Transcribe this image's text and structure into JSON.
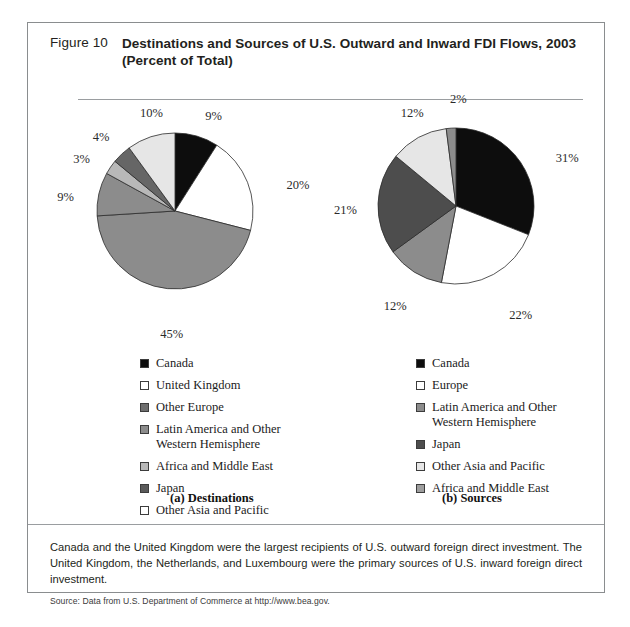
{
  "figure": {
    "number": "Figure 10",
    "title": "Destinations and Sources of U.S. Outward and Inward FDI Flows, 2003 (Percent of Total)"
  },
  "note": {
    "text": "Canada and the United Kingdom were the largest recipients of U.S. outward foreign direct investment. The United Kingdom, the Netherlands, and Luxembourg were the primary sources of U.S. inward foreign direct investment.",
    "source": "Source: Data from U.S. Department of Commerce at http://www.bea.gov."
  },
  "panels": {
    "left": {
      "caption": "(a) Destinations",
      "labels": [
        "9%",
        "20%",
        "45%",
        "9%",
        "3%",
        "4%",
        "10%"
      ]
    },
    "right": {
      "caption": "(b) Sources",
      "labels": [
        "31%",
        "22%",
        "12%",
        "21%",
        "12%",
        "2%"
      ]
    }
  },
  "chart_data": [
    {
      "type": "pie",
      "title": "(a) Destinations",
      "panel": "left",
      "categories": [
        "Canada",
        "United Kingdom",
        "Other Europe",
        "Latin America and Other Western Hemisphere",
        "Africa and Middle East",
        "Japan",
        "Other Asia and Pacific"
      ],
      "values": [
        9,
        20,
        45,
        9,
        3,
        4,
        10
      ],
      "labels": [
        "9%",
        "20%",
        "45%",
        "9%",
        "3%",
        "4%",
        "10%"
      ],
      "colors": [
        "#0d0d0d",
        "#ffffff",
        "#8c8c8c",
        "#8c8c8c",
        "#b8b8b8",
        "#666666",
        "#e6e6e6"
      ],
      "legend_position": "below",
      "units": "Percent of Total"
    },
    {
      "type": "pie",
      "title": "(b) Sources",
      "panel": "right",
      "categories": [
        "Canada",
        "Europe",
        "Latin America and Other Western Hemisphere",
        "Japan",
        "Other Asia and Pacific",
        "Africa and Middle East"
      ],
      "values": [
        31,
        22,
        12,
        21,
        12,
        2
      ],
      "labels": [
        "31%",
        "22%",
        "12%",
        "21%",
        "12%",
        "2%"
      ],
      "colors": [
        "#0d0d0d",
        "#ffffff",
        "#8c8c8c",
        "#4d4d4d",
        "#e6e6e6",
        "#8c8c8c"
      ],
      "legend_position": "below",
      "units": "Percent of Total"
    }
  ],
  "legends": {
    "left": [
      {
        "label": "Canada",
        "color": "#0d0d0d"
      },
      {
        "label": "United Kingdom",
        "color": "#ffffff"
      },
      {
        "label": "Other Europe",
        "color": "#6e6e6e"
      },
      {
        "label": "Latin America and Other Western Hemisphere",
        "color": "#8c8c8c"
      },
      {
        "label": "Africa and Middle East",
        "color": "#b8b8b8"
      },
      {
        "label": "Japan",
        "color": "#5a5a5a"
      },
      {
        "label": "Other Asia and Pacific",
        "color": "#ffffff"
      }
    ],
    "right": [
      {
        "label": "Canada",
        "color": "#0d0d0d"
      },
      {
        "label": "Europe",
        "color": "#ffffff"
      },
      {
        "label": "Latin America and Other Western Hemisphere",
        "color": "#8c8c8c"
      },
      {
        "label": "Japan",
        "color": "#4d4d4d"
      },
      {
        "label": "Other Asia and Pacific",
        "color": "#e6e6e6"
      },
      {
        "label": "Africa and Middle East",
        "color": "#9e9e9e"
      }
    ]
  },
  "geometry": {
    "left_pie": {
      "cx": 147,
      "cy": 188,
      "r": 78,
      "start_angle": -90
    },
    "right_pie": {
      "cx": 428,
      "cy": 183,
      "r": 78,
      "start_angle": -90
    },
    "label_offsets": {
      "left": [
        {
          "i": 0,
          "dx": 4,
          "dy": -12
        },
        {
          "i": 1,
          "dx": 24,
          "dy": 2
        },
        {
          "i": 2,
          "dx": -6,
          "dy": 22
        },
        {
          "i": 3,
          "dx": -26,
          "dy": 0
        },
        {
          "i": 4,
          "dx": -24,
          "dy": -6
        },
        {
          "i": 5,
          "dx": -18,
          "dy": -12
        },
        {
          "i": 6,
          "dx": -6,
          "dy": -16
        }
      ],
      "right": [
        {
          "i": 0,
          "dx": 22,
          "dy": -2
        },
        {
          "i": 1,
          "dx": 8,
          "dy": 20
        },
        {
          "i": 2,
          "dx": -22,
          "dy": 14
        },
        {
          "i": 3,
          "dx": -28,
          "dy": 0
        },
        {
          "i": 4,
          "dx": -10,
          "dy": -18
        },
        {
          "i": 5,
          "dx": 0,
          "dy": -20
        }
      ]
    }
  }
}
